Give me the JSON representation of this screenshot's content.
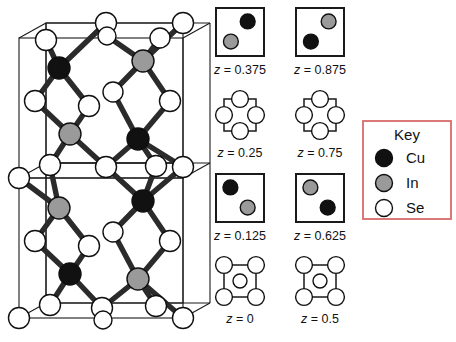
{
  "figure": {
    "background": "#ffffff"
  },
  "colors": {
    "cu": "#111111",
    "in": "#9a9a9a",
    "se": "#ffffff",
    "bond": "#2b2b2b",
    "cell_edge": "#1a1a1a",
    "key_border": "#d86a6a",
    "text": "#111111"
  },
  "unit_cell": {
    "name": "chalcopyrite-unit-cell",
    "atoms": [
      {
        "id": "se-t1",
        "type": "Se",
        "cx": 46,
        "cy": 40,
        "r": 10.5
      },
      {
        "id": "se-t2",
        "type": "Se",
        "cx": 106,
        "cy": 23,
        "r": 10.5
      },
      {
        "id": "se-t3",
        "type": "Se",
        "cx": 107,
        "cy": 36,
        "r": 9.0
      },
      {
        "id": "se-t4",
        "type": "Se",
        "cx": 160,
        "cy": 38,
        "r": 10.0
      },
      {
        "id": "se-t5",
        "type": "Se",
        "cx": 183,
        "cy": 23,
        "r": 10.5
      },
      {
        "id": "cu-a",
        "type": "Cu",
        "cx": 59,
        "cy": 68,
        "r": 11.0
      },
      {
        "id": "in-a",
        "type": "In",
        "cx": 143,
        "cy": 61,
        "r": 11.0
      },
      {
        "id": "se-m1",
        "type": "Se",
        "cx": 35,
        "cy": 101,
        "r": 10.5
      },
      {
        "id": "se-m2",
        "type": "Se",
        "cx": 89,
        "cy": 106,
        "r": 10.5
      },
      {
        "id": "se-m3",
        "type": "Se",
        "cx": 113,
        "cy": 92,
        "r": 10.0
      },
      {
        "id": "se-m4",
        "type": "Se",
        "cx": 170,
        "cy": 101,
        "r": 10.5
      },
      {
        "id": "in-b",
        "type": "In",
        "cx": 70,
        "cy": 134,
        "r": 11.0
      },
      {
        "id": "cu-b",
        "type": "Cu",
        "cx": 138,
        "cy": 139,
        "r": 11.0
      },
      {
        "id": "se-c1",
        "type": "Se",
        "cx": 50,
        "cy": 165,
        "r": 10.5
      },
      {
        "id": "se-c2",
        "type": "Se",
        "cx": 19,
        "cy": 178,
        "r": 10.5
      },
      {
        "id": "se-c3",
        "type": "Se",
        "cx": 106,
        "cy": 167,
        "r": 10.5
      },
      {
        "id": "se-c4",
        "type": "Se",
        "cx": 156,
        "cy": 166,
        "r": 10.5
      },
      {
        "id": "se-c5",
        "type": "Se",
        "cx": 183,
        "cy": 167,
        "r": 10.5
      },
      {
        "id": "in-c",
        "type": "In",
        "cx": 59,
        "cy": 208,
        "r": 11.0
      },
      {
        "id": "cu-c",
        "type": "Cu",
        "cx": 143,
        "cy": 201,
        "r": 11.0
      },
      {
        "id": "se-l1",
        "type": "Se",
        "cx": 35,
        "cy": 241,
        "r": 10.5
      },
      {
        "id": "se-l2",
        "type": "Se",
        "cx": 89,
        "cy": 246,
        "r": 10.5
      },
      {
        "id": "se-l3",
        "type": "Se",
        "cx": 113,
        "cy": 232,
        "r": 10.0
      },
      {
        "id": "se-l4",
        "type": "Se",
        "cx": 170,
        "cy": 241,
        "r": 10.5
      },
      {
        "id": "cu-d",
        "type": "Cu",
        "cx": 70,
        "cy": 274,
        "r": 11.0
      },
      {
        "id": "in-d",
        "type": "In",
        "cx": 138,
        "cy": 279,
        "r": 11.0
      },
      {
        "id": "se-b1",
        "type": "Se",
        "cx": 50,
        "cy": 305,
        "r": 10.5
      },
      {
        "id": "se-b2",
        "type": "Se",
        "cx": 19,
        "cy": 318,
        "r": 10.5
      },
      {
        "id": "se-b3",
        "type": "Se",
        "cx": 102,
        "cy": 308,
        "r": 10.5
      },
      {
        "id": "se-b4",
        "type": "Se",
        "cx": 103,
        "cy": 320,
        "r": 9.0
      },
      {
        "id": "se-b5",
        "type": "Se",
        "cx": 156,
        "cy": 306,
        "r": 10.5
      },
      {
        "id": "se-b6",
        "type": "Se",
        "cx": 183,
        "cy": 318,
        "r": 10.5
      }
    ],
    "bonds": [
      [
        "se-t1",
        "cu-a"
      ],
      [
        "se-t2",
        "cu-a"
      ],
      [
        "cu-a",
        "se-m1"
      ],
      [
        "cu-a",
        "se-m2"
      ],
      [
        "se-t3",
        "in-a"
      ],
      [
        "se-t4",
        "in-a"
      ],
      [
        "se-t5",
        "in-a"
      ],
      [
        "in-a",
        "se-m3"
      ],
      [
        "in-a",
        "se-m4"
      ],
      [
        "se-m1",
        "in-b"
      ],
      [
        "se-m2",
        "in-b"
      ],
      [
        "in-b",
        "se-c1"
      ],
      [
        "in-b",
        "se-c3"
      ],
      [
        "se-m3",
        "cu-b"
      ],
      [
        "se-m4",
        "cu-b"
      ],
      [
        "cu-b",
        "se-c3"
      ],
      [
        "cu-b",
        "se-c4"
      ],
      [
        "cu-b",
        "se-c5"
      ],
      [
        "se-c1",
        "in-c"
      ],
      [
        "se-c2",
        "in-c"
      ],
      [
        "in-c",
        "se-l1"
      ],
      [
        "in-c",
        "se-l2"
      ],
      [
        "se-c3",
        "cu-c"
      ],
      [
        "se-c4",
        "cu-c"
      ],
      [
        "se-c5",
        "cu-c"
      ],
      [
        "cu-c",
        "se-l3"
      ],
      [
        "cu-c",
        "se-l4"
      ],
      [
        "se-l1",
        "cu-d"
      ],
      [
        "se-l2",
        "cu-d"
      ],
      [
        "cu-d",
        "se-b1"
      ],
      [
        "cu-d",
        "se-b3"
      ],
      [
        "se-l3",
        "in-d"
      ],
      [
        "se-l4",
        "in-d"
      ],
      [
        "in-d",
        "se-b3"
      ],
      [
        "in-d",
        "se-b5"
      ],
      [
        "in-d",
        "se-b6"
      ]
    ]
  },
  "z_panels": [
    {
      "id": "panel-z-0375",
      "label": "z = 0.375",
      "label_z": "z",
      "label_eq": " = 0.375",
      "style": "filled",
      "circles": [
        {
          "type": "Cu",
          "cx": 0.66,
          "cy": 0.28,
          "r": 0.155
        },
        {
          "type": "In",
          "cx": 0.31,
          "cy": 0.7,
          "r": 0.155
        }
      ]
    },
    {
      "id": "panel-z-0875",
      "label": "z = 0.875",
      "label_z": "z",
      "label_eq": " = 0.875",
      "style": "filled",
      "circles": [
        {
          "type": "In",
          "cx": 0.68,
          "cy": 0.28,
          "r": 0.155
        },
        {
          "type": "Cu",
          "cx": 0.31,
          "cy": 0.7,
          "r": 0.155
        }
      ]
    },
    {
      "id": "panel-z-025",
      "label": "z = 0.25",
      "label_z": "z",
      "label_eq": " = 0.25",
      "style": "edge-midpoints",
      "circles": [
        {
          "type": "Se",
          "cx": 0.5,
          "cy": 0.0,
          "r": 0.175
        },
        {
          "type": "Se",
          "cx": 0.0,
          "cy": 0.5,
          "r": 0.175
        },
        {
          "type": "Se",
          "cx": 1.0,
          "cy": 0.5,
          "r": 0.175
        },
        {
          "type": "Se",
          "cx": 0.5,
          "cy": 1.0,
          "r": 0.175
        }
      ]
    },
    {
      "id": "panel-z-075",
      "label": "z = 0.75",
      "label_z": "z",
      "label_eq": " = 0.75",
      "style": "edge-midpoints",
      "circles": [
        {
          "type": "Se",
          "cx": 0.5,
          "cy": 0.0,
          "r": 0.175
        },
        {
          "type": "Se",
          "cx": 0.0,
          "cy": 0.5,
          "r": 0.175
        },
        {
          "type": "Se",
          "cx": 1.0,
          "cy": 0.5,
          "r": 0.175
        },
        {
          "type": "Se",
          "cx": 0.5,
          "cy": 1.0,
          "r": 0.175
        }
      ]
    },
    {
      "id": "panel-z-0125",
      "label": "z = 0.125",
      "label_z": "z",
      "label_eq": " = 0.125",
      "style": "filled",
      "circles": [
        {
          "type": "Cu",
          "cx": 0.3,
          "cy": 0.28,
          "r": 0.155
        },
        {
          "type": "In",
          "cx": 0.66,
          "cy": 0.7,
          "r": 0.155
        }
      ]
    },
    {
      "id": "panel-z-0625",
      "label": "z = 0.625",
      "label_z": "z",
      "label_eq": " = 0.625",
      "style": "filled",
      "circles": [
        {
          "type": "In",
          "cx": 0.3,
          "cy": 0.28,
          "r": 0.155
        },
        {
          "type": "Cu",
          "cx": 0.66,
          "cy": 0.7,
          "r": 0.155
        }
      ]
    },
    {
      "id": "panel-z-0",
      "label": "z = 0",
      "label_z": "z",
      "label_eq": " = 0",
      "style": "corners-center",
      "circles": [
        {
          "type": "Se",
          "cx": 0.0,
          "cy": 0.0,
          "r": 0.175
        },
        {
          "type": "Se",
          "cx": 1.0,
          "cy": 0.0,
          "r": 0.175
        },
        {
          "type": "Se",
          "cx": 0.0,
          "cy": 1.0,
          "r": 0.175
        },
        {
          "type": "Se",
          "cx": 1.0,
          "cy": 1.0,
          "r": 0.175
        },
        {
          "type": "Se",
          "cx": 0.5,
          "cy": 0.5,
          "r": 0.145
        }
      ]
    },
    {
      "id": "panel-z-05",
      "label": "z = 0.5",
      "label_z": "z",
      "label_eq": " = 0.5",
      "style": "corners-center",
      "circles": [
        {
          "type": "Se",
          "cx": 0.0,
          "cy": 0.0,
          "r": 0.175
        },
        {
          "type": "Se",
          "cx": 1.0,
          "cy": 0.0,
          "r": 0.175
        },
        {
          "type": "Se",
          "cx": 0.0,
          "cy": 1.0,
          "r": 0.175
        },
        {
          "type": "Se",
          "cx": 1.0,
          "cy": 1.0,
          "r": 0.175
        },
        {
          "type": "Se",
          "cx": 0.5,
          "cy": 0.5,
          "r": 0.145
        }
      ]
    }
  ],
  "key": {
    "title": "Key",
    "entries": [
      {
        "symbol": "Cu",
        "type": "Cu",
        "label": "Cu"
      },
      {
        "symbol": "In",
        "type": "In",
        "label": "In"
      },
      {
        "symbol": "Se",
        "type": "Se",
        "label": "Se"
      }
    ]
  }
}
